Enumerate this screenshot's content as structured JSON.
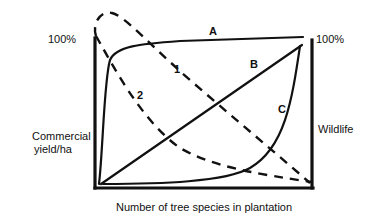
{
  "diagram": {
    "type": "conceptual-line-diagram",
    "y_left": {
      "title_line1": "Commercial",
      "title_line2": "yield/ha",
      "max_label": "100%"
    },
    "y_right": {
      "title": "Wildlife",
      "max_label": "100%"
    },
    "x_axis": {
      "title": "Number of tree species in plantation"
    },
    "curves": [
      {
        "id": "A",
        "label": "A",
        "style": "solid",
        "meaning": "wildlife curve rising sharply then saturating near 100%"
      },
      {
        "id": "B",
        "label": "B",
        "style": "solid",
        "meaning": "wildlife curve rising linearly"
      },
      {
        "id": "C",
        "label": "C",
        "style": "solid",
        "meaning": "wildlife curve flat then rising sharply at high species numbers"
      },
      {
        "id": "1",
        "label": "1",
        "style": "dashed",
        "meaning": "commercial yield declining gradually"
      },
      {
        "id": "2",
        "label": "2",
        "style": "dashed",
        "meaning": "commercial yield declining rapidly"
      }
    ],
    "colors": {
      "ink": "#111111",
      "background": "#ffffff"
    }
  },
  "geometry": {
    "frame": {
      "left_axis": "M95,38 L95,188",
      "bottom_axis": "M95,188 L313,188",
      "right_axis": "M312,40 L312,188"
    },
    "paths": {
      "A": "M99,184 C103,150 104,80 110,60 C116,46 140,44 180,41 L303,37",
      "B": "M101,184 L302,45",
      "C": "M103,184 C160,184 225,182 250,168 C285,148 292,100 300,46",
      "1": "M96,36 C92,24 100,10 112,13 C125,16 150,45 190,80 C230,115 270,148 310,183",
      "2": "M96,36 C110,60 140,120 180,148 C215,168 260,174 311,182"
    }
  }
}
